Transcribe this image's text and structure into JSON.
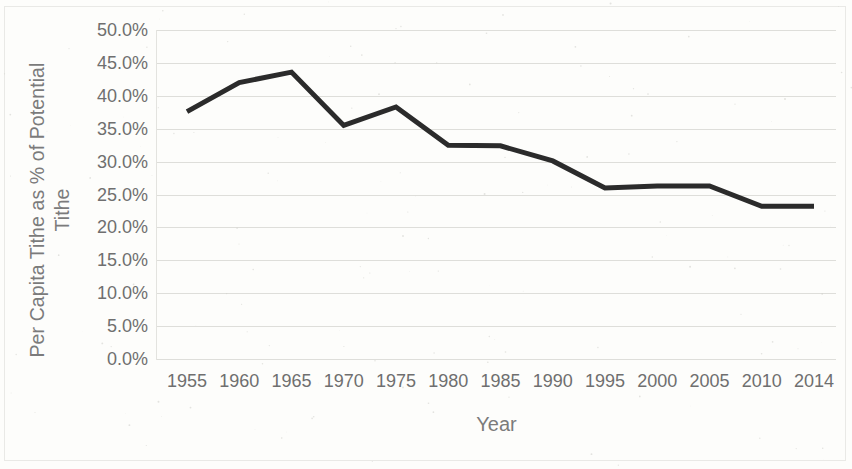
{
  "chart_data": {
    "type": "line",
    "title": "",
    "xlabel": "Year",
    "ylabel": "Per Capita Tithe as % of Potential Tithe",
    "ylabel_line1": "Per Capita Tithe as % of Potential",
    "ylabel_line2": "Tithe",
    "categories": [
      "1955",
      "1960",
      "1965",
      "1970",
      "1975",
      "1980",
      "1985",
      "1990",
      "1995",
      "2000",
      "2005",
      "2010",
      "2014"
    ],
    "x": [
      1955,
      1960,
      1965,
      1970,
      1975,
      1980,
      1985,
      1990,
      1995,
      2000,
      2005,
      2010,
      2014
    ],
    "values": [
      37.6,
      42.0,
      43.6,
      35.5,
      38.3,
      32.5,
      32.4,
      30.1,
      26.0,
      26.3,
      26.3,
      23.2,
      23.2
    ],
    "y_tick_labels": [
      "50.0%",
      "45.0%",
      "40.0%",
      "35.0%",
      "30.0%",
      "25.0%",
      "20.0%",
      "15.0%",
      "10.0%",
      "5.0%",
      "0.0%"
    ],
    "y_tick_values": [
      50,
      45,
      40,
      35,
      30,
      25,
      20,
      15,
      10,
      5,
      0
    ],
    "ylim": [
      0,
      50
    ],
    "grid": true,
    "legend": false,
    "legend_position": "none",
    "series_color": "#2b2b2b",
    "gridline_color": "#dededa",
    "text_color": "#6f6f6f",
    "background_color": "#fdfdfb"
  }
}
